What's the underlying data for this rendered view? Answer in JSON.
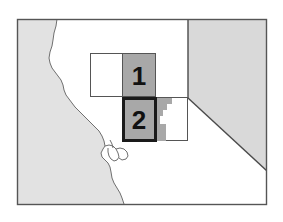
{
  "figure": {
    "type": "locator-map",
    "title": "",
    "width": 283,
    "height": 222,
    "background_color": "#ffffff"
  },
  "frame": {
    "name": "map-frame",
    "x": 17,
    "y": 19,
    "width": 250,
    "height": 186,
    "stroke_color": "#555555",
    "fill_color": "#ffffff"
  },
  "regions": [
    {
      "id": "pacific-ocean",
      "label": "Pacific Ocean",
      "fill_color": "#e2e2e2",
      "stroke_color": "#777777"
    },
    {
      "id": "california-land",
      "label": "California",
      "fill_color": "#ffffff",
      "stroke_color": "#777777"
    },
    {
      "id": "nevada",
      "label": "Nevada",
      "fill_color": "#d9d9d9",
      "stroke_color": "#555555"
    }
  ],
  "study_boxes": [
    {
      "id": "study-box-upper",
      "label": "",
      "x": 90,
      "y": 53,
      "width": 66,
      "height": 44,
      "fill_color": "#ffffff",
      "stroke_color": "#555555"
    },
    {
      "id": "study-box-lower",
      "label": "",
      "x": 122,
      "y": 97,
      "width": 66,
      "height": 44,
      "fill_color": "#ffffff",
      "stroke_color": "#555555"
    }
  ],
  "inset_shading": [
    {
      "id": "shading-upper",
      "fill_color": "#a8a8a8"
    },
    {
      "id": "shading-stair",
      "fill_color": "#a8a8a8"
    }
  ],
  "numbered_tiles": [
    {
      "id": "tile-1",
      "number": "1",
      "x": 122,
      "y": 53,
      "width": 34,
      "height": 44,
      "fill_color": "#a8a8a8",
      "stroke_color": "#555555",
      "stroke_width": 1,
      "text_color": "#111111"
    },
    {
      "id": "tile-2",
      "number": "2",
      "x": 122,
      "y": 97,
      "width": 34,
      "height": 44,
      "fill_color": "#a8a8a8",
      "stroke_color": "#1a1a1a",
      "stroke_width": 3,
      "text_color": "#111111"
    }
  ],
  "borders": {
    "ca_nv_vertical": {
      "x": 188,
      "y1": 20,
      "y2": 98,
      "style": "solid"
    },
    "ca_nv_diagonal": {
      "x1": 188,
      "y1": 98,
      "x2": 266,
      "y2": 171,
      "style": "solid"
    }
  },
  "palette": {
    "ocean_gray": "#e2e2e2",
    "state_gray": "#d9d9d9",
    "tile_gray": "#a8a8a8",
    "line_gray": "#777777",
    "frame_gray": "#555555",
    "text_black": "#111111",
    "white": "#ffffff"
  }
}
